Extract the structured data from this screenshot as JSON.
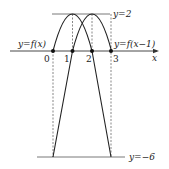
{
  "diagram": {
    "type": "function-graph",
    "axis": {
      "x_label": "x"
    },
    "ticks": [
      {
        "label": "0",
        "value": 0
      },
      {
        "label": "1",
        "value": 1
      },
      {
        "label": "2",
        "value": 2
      },
      {
        "label": "3",
        "value": 3
      }
    ],
    "curves": [
      {
        "label": "y=f(x)",
        "vertex": [
          1,
          2
        ],
        "roots": [
          0,
          2
        ]
      },
      {
        "label": "y=f(x−1)",
        "vertex": [
          2,
          2
        ],
        "roots": [
          1,
          3
        ]
      }
    ],
    "horizontal_lines": [
      {
        "label": "y=2",
        "value": 2
      },
      {
        "label": "y=−6",
        "value": -6
      }
    ],
    "colors": {
      "stroke": "#222222",
      "dashed": "#444444"
    }
  }
}
